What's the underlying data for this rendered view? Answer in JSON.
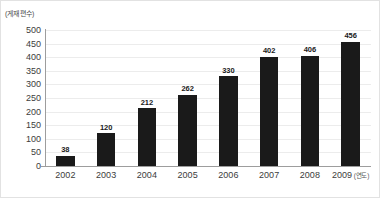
{
  "chart_data": {
    "type": "bar",
    "title": "",
    "subtitle": "",
    "xlabel": "(연도)",
    "ylabel": "(게재 편수)",
    "categories": [
      "2002",
      "2003",
      "2004",
      "2005",
      "2006",
      "2007",
      "2008",
      "2009"
    ],
    "values": [
      38,
      120,
      212,
      262,
      330,
      402,
      406,
      456
    ],
    "ylim": [
      0,
      500
    ],
    "ytick_step": 50,
    "yticks": [
      0,
      50,
      100,
      150,
      200,
      250,
      300,
      350,
      400,
      450,
      500
    ],
    "ytick_labels": [
      "0",
      "50",
      "100",
      "150",
      "200",
      "250",
      "300",
      "350",
      "400",
      "450",
      "500"
    ],
    "data_labels": [
      "38",
      "120",
      "212",
      "262",
      "330",
      "402",
      "406",
      "456"
    ],
    "grid": true,
    "grid_axis": "y",
    "legend": false,
    "legend_position": "none",
    "bar_color": "#1a1a1a",
    "grid_color": "#ececec",
    "axis_color": "#9d9d9d",
    "text_color": "#3c3c3c"
  }
}
